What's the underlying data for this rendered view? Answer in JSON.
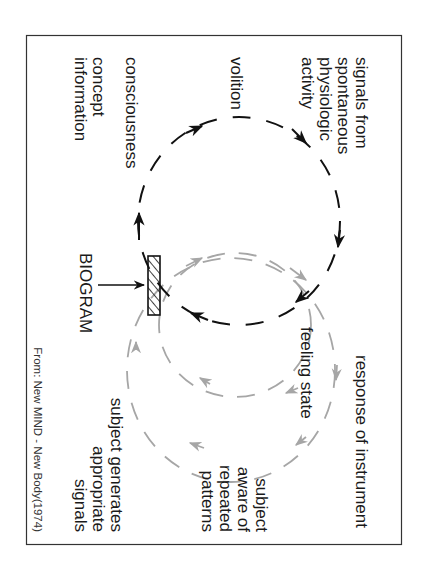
{
  "diagram": {
    "orientation": "rotated-90-clockwise",
    "colors": {
      "border": "#333333",
      "primary_loop": "#111111",
      "feedback_loop": "#a6a6a6",
      "text": "#1a1a1a"
    },
    "labels": {
      "signals": [
        "signals from",
        "spontaneous",
        "physiologic",
        "activity"
      ],
      "volition": "volition",
      "consciousness": "consciousness",
      "concept": [
        "concept",
        "information"
      ],
      "biogram": "BIOGRAM",
      "response": "response of instrument",
      "feeling": "feeling state",
      "aware": [
        "subject",
        "aware of",
        "repeated",
        "patterns"
      ],
      "generates": [
        "subject generates",
        "appropriate",
        "signals"
      ]
    },
    "footer": "From: New MIND - New Body(1974)"
  }
}
